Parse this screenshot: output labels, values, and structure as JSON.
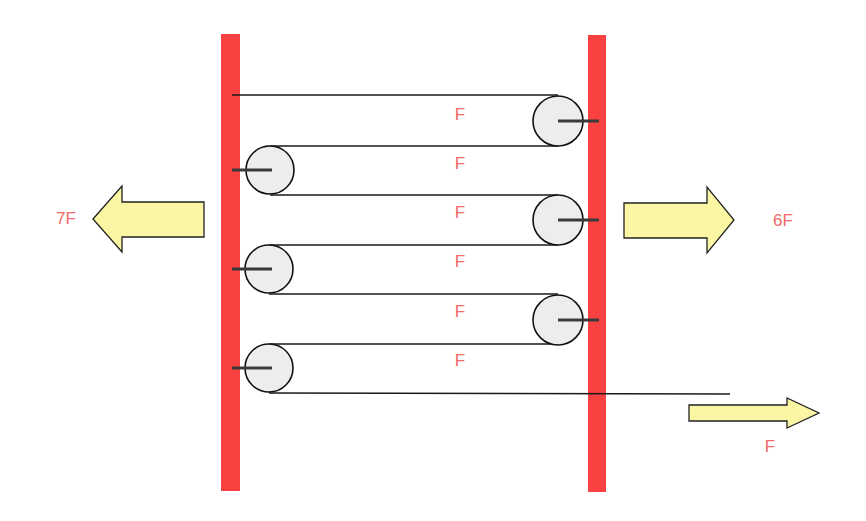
{
  "diagram": {
    "title": "",
    "colors": {
      "wall": "#f94141",
      "rope": "#1a1a1a",
      "pulley_fill": "#ededed",
      "pulley_stroke": "#111111",
      "axle": "#3a3a3a",
      "arrow_fill": "#fbf6a4",
      "arrow_stroke": "#222222",
      "label": "#f26a6a"
    },
    "walls": [
      {
        "id": "left-wall",
        "x": 221,
        "y": 34,
        "width": 19,
        "height": 457
      },
      {
        "id": "right-wall",
        "x": 588,
        "y": 35,
        "width": 18,
        "height": 457
      }
    ],
    "pulleys": [
      {
        "id": "right-pulley-1",
        "side": "right",
        "cx": 558,
        "cy": 121,
        "r": 25
      },
      {
        "id": "left-pulley-1",
        "side": "left",
        "cx": 270,
        "cy": 170,
        "r": 24
      },
      {
        "id": "right-pulley-2",
        "side": "right",
        "cx": 558,
        "cy": 220,
        "r": 25
      },
      {
        "id": "left-pulley-2",
        "side": "left",
        "cx": 269,
        "cy": 269,
        "r": 24
      },
      {
        "id": "right-pulley-3",
        "side": "right",
        "cx": 558,
        "cy": 320,
        "r": 25
      },
      {
        "id": "left-pulley-3",
        "side": "left",
        "cx": 269,
        "cy": 368,
        "r": 24
      }
    ],
    "rope_segment_labels": [
      {
        "text": "F",
        "x": 460,
        "y": 114
      },
      {
        "text": "F",
        "x": 460,
        "y": 163
      },
      {
        "text": "F",
        "x": 460,
        "y": 212
      },
      {
        "text": "F",
        "x": 460,
        "y": 261
      },
      {
        "text": "F",
        "x": 460,
        "y": 311
      },
      {
        "text": "F",
        "x": 460,
        "y": 360
      }
    ],
    "force_arrows": [
      {
        "id": "left-wall-force",
        "direction": "left",
        "label": "7F",
        "label_x": 66,
        "label_y": 218
      },
      {
        "id": "right-wall-force",
        "direction": "right",
        "label": "6F",
        "label_x": 783,
        "label_y": 220
      },
      {
        "id": "rope-pull-force",
        "direction": "right",
        "label": "F",
        "label_x": 770,
        "label_y": 446
      }
    ]
  }
}
